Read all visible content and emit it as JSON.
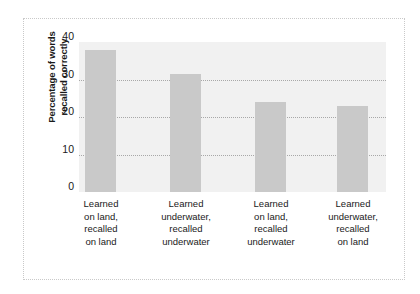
{
  "chart_data": {
    "type": "bar",
    "title": "",
    "xlabel": "",
    "ylabel": "Percentage of words recalled correctly",
    "ylabel_lines": [
      "Percentage of words",
      "recalled correctly"
    ],
    "categories": [
      "Learned on land, recalled on land",
      "Learned underwater, recalled underwater",
      "Learned on land, recalled underwater",
      "Learned underwater, recalled on land"
    ],
    "category_lines": [
      [
        "Learned",
        "on land,",
        "recalled",
        "on land"
      ],
      [
        "Learned",
        "underwater,",
        "recalled",
        "underwater"
      ],
      [
        "Learned",
        "on land,",
        "recalled",
        "underwater"
      ],
      [
        "Learned",
        "underwater,",
        "recalled",
        "on land"
      ]
    ],
    "values": [
      38,
      31.5,
      24,
      23
    ],
    "ylim": [
      0,
      40
    ],
    "yticks": [
      0,
      10,
      20,
      30,
      40
    ],
    "ytick_labels": [
      "0",
      "10",
      "20",
      "30",
      "40"
    ],
    "gridlines": [
      10,
      20,
      30
    ],
    "grid": true,
    "legend": null,
    "bar_color": "#c9c9c9",
    "plot_background": "#f1f1f1",
    "frame_color": "#c9c9c9"
  }
}
